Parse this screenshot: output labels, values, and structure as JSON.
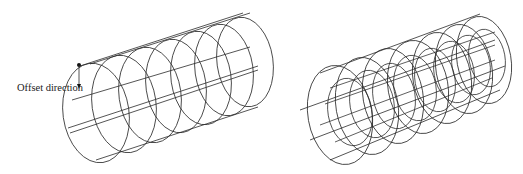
{
  "figures": [
    {
      "id": "left",
      "description": "Single wireframe cylinder with offset direction marker",
      "annotation": {
        "text": "Offset direction",
        "arrow_direction": "down"
      },
      "rings": 7
    },
    {
      "id": "right",
      "description": "Nested concentric wireframe cylinders",
      "outer_rings": 7,
      "inner_rings": 8
    }
  ],
  "colors": {
    "stroke": "#2a2a2a",
    "background": "#ffffff"
  }
}
